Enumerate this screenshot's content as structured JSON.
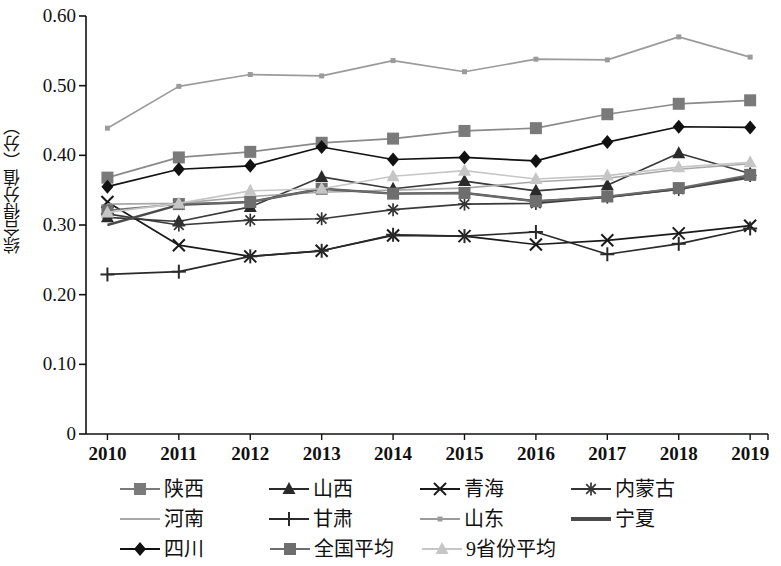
{
  "chart_data": {
    "type": "line",
    "title": "",
    "xlabel": "",
    "ylabel": "综合得分值（分）",
    "x": [
      2010,
      2011,
      2012,
      2013,
      2014,
      2015,
      2016,
      2017,
      2018,
      2019
    ],
    "categories": [
      "2010",
      "2011",
      "2012",
      "2013",
      "2014",
      "2015",
      "2016",
      "2017",
      "2018",
      "2019"
    ],
    "ylim": [
      0,
      0.6
    ],
    "yticks": [
      0,
      0.1,
      0.2,
      0.3,
      0.4,
      0.5,
      0.6
    ],
    "ytick_labels": [
      "0",
      "0.10",
      "0.20",
      "0.30",
      "0.40",
      "0.50",
      "0.60"
    ],
    "grid": false,
    "legend_position": "bottom",
    "series": [
      {
        "name": "陕西",
        "marker": "square",
        "color": "#7a7a7a",
        "line_color": "#8a8a8a",
        "values": [
          0.368,
          0.397,
          0.405,
          0.418,
          0.424,
          0.435,
          0.439,
          0.459,
          0.474,
          0.479
        ]
      },
      {
        "name": "山西",
        "marker": "triangle",
        "color": "#2a2a2a",
        "line_color": "#3a3a3a",
        "values": [
          0.311,
          0.305,
          0.326,
          0.369,
          0.352,
          0.363,
          0.349,
          0.357,
          0.403,
          0.374
        ]
      },
      {
        "name": "青海",
        "marker": "x",
        "color": "#1a1a1a",
        "line_color": "#1a1a1a",
        "values": [
          0.333,
          0.271,
          0.255,
          0.263,
          0.285,
          0.284,
          0.272,
          0.278,
          0.288,
          0.299
        ]
      },
      {
        "name": "内蒙古",
        "marker": "asterisk",
        "color": "#333333",
        "line_color": "#3a3a3a",
        "values": [
          0.316,
          0.3,
          0.307,
          0.309,
          0.322,
          0.33,
          0.331,
          0.34,
          0.351,
          0.371
        ]
      },
      {
        "name": "河南",
        "marker": "none",
        "color": "#a8a8a8",
        "line_color": "#a8a8a8",
        "values": [
          0.33,
          0.331,
          0.341,
          0.347,
          0.35,
          0.353,
          0.362,
          0.367,
          0.38,
          0.388
        ]
      },
      {
        "name": "甘肃",
        "marker": "plus",
        "color": "#2a2a2a",
        "line_color": "#2a2a2a",
        "values": [
          0.229,
          0.233,
          0.255,
          0.263,
          0.286,
          0.284,
          0.29,
          0.258,
          0.273,
          0.295
        ]
      },
      {
        "name": "山东",
        "marker": "small-square",
        "color": "#9b9b9b",
        "line_color": "#9b9b9b",
        "values": [
          0.439,
          0.499,
          0.516,
          0.514,
          0.536,
          0.52,
          0.538,
          0.537,
          0.57,
          0.541
        ]
      },
      {
        "name": "宁夏",
        "marker": "none-thick",
        "color": "#4a4a4a",
        "line_color": "#4a4a4a",
        "values": [
          0.3,
          0.329,
          0.333,
          0.352,
          0.345,
          0.346,
          0.334,
          0.34,
          0.352,
          0.368
        ]
      },
      {
        "name": "四川",
        "marker": "diamond",
        "color": "#111111",
        "line_color": "#111111",
        "values": [
          0.355,
          0.38,
          0.385,
          0.412,
          0.394,
          0.397,
          0.392,
          0.419,
          0.441,
          0.44
        ]
      },
      {
        "name": "全国平均",
        "marker": "square",
        "color": "#6e6e6e",
        "line_color": "#6e6e6e",
        "values": [
          0.321,
          0.33,
          0.333,
          0.352,
          0.345,
          0.346,
          0.334,
          0.341,
          0.353,
          0.372
        ]
      },
      {
        "name": "9省份平均",
        "marker": "triangle",
        "color": "#c6c6c6",
        "line_color": "#c6c6c6",
        "values": [
          0.318,
          0.331,
          0.349,
          0.352,
          0.37,
          0.378,
          0.366,
          0.371,
          0.383,
          0.39
        ]
      }
    ]
  },
  "axis": {
    "y_title": "综合得分值（分）",
    "y_tick_labels": [
      "0.60",
      "0.50",
      "0.40",
      "0.30",
      "0.20",
      "0.10",
      "0"
    ],
    "x_tick_labels": [
      "2010",
      "2011",
      "2012",
      "2013",
      "2014",
      "2015",
      "2016",
      "2017",
      "2018",
      "2019"
    ]
  },
  "legend": {
    "rows": [
      [
        {
          "label": "陕西",
          "marker": "square",
          "color": "#7a7a7a"
        },
        {
          "label": "山西",
          "marker": "triangle",
          "color": "#2a2a2a"
        },
        {
          "label": "青海",
          "marker": "x",
          "color": "#1a1a1a"
        },
        {
          "label": "内蒙古",
          "marker": "asterisk",
          "color": "#333333"
        }
      ],
      [
        {
          "label": "河南",
          "marker": "none",
          "color": "#a8a8a8"
        },
        {
          "label": "甘肃",
          "marker": "plus",
          "color": "#2a2a2a"
        },
        {
          "label": "山东",
          "marker": "small-square",
          "color": "#9b9b9b"
        },
        {
          "label": "宁夏",
          "marker": "none-thick",
          "color": "#4a4a4a"
        }
      ],
      [
        {
          "label": "四川",
          "marker": "diamond",
          "color": "#111111"
        },
        {
          "label": "全国平均",
          "marker": "square",
          "color": "#6e6e6e"
        },
        {
          "label": "9省份平均",
          "marker": "triangle",
          "color": "#c6c6c6"
        }
      ]
    ]
  }
}
